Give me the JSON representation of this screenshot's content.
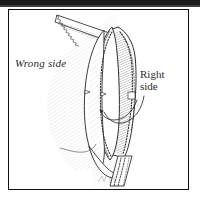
{
  "figure": {
    "kind": "line-drawing",
    "medium": "pen-and-ink-hatched-illustration",
    "background_color": "#ffffff",
    "ink_color": "#2b2b2b",
    "frame": {
      "present": true,
      "color": "#0f0f0f",
      "style": "thin rectangular rule border"
    },
    "top_artifact": {
      "present": true,
      "color": "#1b1b1b",
      "description": "dark scanned page-edge bar"
    }
  },
  "labels": {
    "wrong_side": "Wrong side",
    "right_side_line1": "Right",
    "right_side_line2": "side"
  },
  "leaders": {
    "count": 2,
    "description": "two curved leader lines from the Right side label to the fabric edge"
  }
}
